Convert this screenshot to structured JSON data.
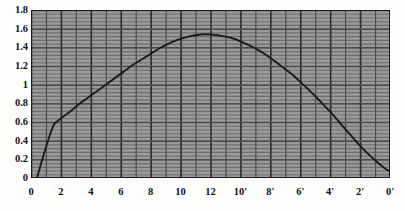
{
  "chart_data": {
    "type": "line",
    "title": "",
    "subtitle": "",
    "xlabel": "",
    "ylabel": "",
    "xlim": [
      0,
      24
    ],
    "ylim": [
      0,
      1.8
    ],
    "grid": true,
    "legend": "none",
    "y_ticks": [
      "0",
      "0.2",
      "0.4",
      "0.6",
      "0.8",
      "1",
      "1.2",
      "1.4",
      "1.6",
      "1.8"
    ],
    "y_tick_values": [
      0,
      0.2,
      0.4,
      0.6,
      0.8,
      1.0,
      1.2,
      1.4,
      1.6,
      1.8
    ],
    "x_ticks": [
      "0",
      "2",
      "4",
      "6",
      "8",
      "10",
      "12",
      "10'",
      "8'",
      "6'",
      "4'",
      "2'",
      "0'"
    ],
    "x_tick_positions": [
      0,
      2,
      4,
      6,
      8,
      10,
      12,
      14,
      16,
      18,
      20,
      22,
      24
    ],
    "series": [
      {
        "name": "curve",
        "color": "#1b1b1b",
        "x": [
          0.4,
          0.7,
          1.0,
          1.3,
          1.55,
          2.0,
          2.6,
          3.2,
          3.8,
          4.4,
          5.0,
          5.6,
          6.2,
          6.8,
          7.4,
          8.0,
          8.6,
          9.2,
          9.8,
          10.4,
          11.0,
          11.6,
          12.2,
          12.8,
          13.4,
          14.0,
          14.6,
          15.2,
          15.8,
          16.4,
          17.0,
          17.6,
          18.2,
          18.8,
          19.4,
          20.0,
          20.6,
          21.2,
          21.8,
          22.4,
          23.0,
          23.6,
          24.0
        ],
        "y": [
          0.0,
          0.17,
          0.33,
          0.48,
          0.58,
          0.64,
          0.71,
          0.79,
          0.86,
          0.93,
          1.0,
          1.07,
          1.14,
          1.21,
          1.27,
          1.33,
          1.39,
          1.44,
          1.48,
          1.51,
          1.53,
          1.54,
          1.535,
          1.52,
          1.5,
          1.465,
          1.42,
          1.37,
          1.31,
          1.24,
          1.165,
          1.09,
          1.0,
          0.91,
          0.81,
          0.71,
          0.6,
          0.49,
          0.38,
          0.28,
          0.19,
          0.11,
          0.07
        ],
        "peak_x": 11.6,
        "peak_y": 1.54,
        "start_x": 0.4,
        "kink_x": 1.55,
        "kink_y": 0.58
      }
    ]
  },
  "style": {
    "plot_background": "#9a9a9a",
    "grid_color": "#4a4a4a",
    "grid_minor_color": "#6e6e6e",
    "axis_color": "#1a1a1a",
    "curve_color": "#1b1b1b",
    "page_background": "#fdfdfc",
    "label_color": "#111111"
  }
}
